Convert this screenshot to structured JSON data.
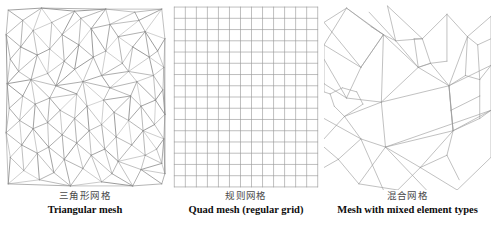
{
  "figure": {
    "background_color": "#ffffff",
    "mesh_line_color": "#8a8a8a",
    "caption_cn_color": "#4a4a4a",
    "caption_en_color": "#0d0d0d",
    "panel_count": 3
  },
  "panels": [
    {
      "id": "triangular-mesh",
      "caption_cn": "三角形网格",
      "caption_en": "Triangular mesh",
      "mesh_type": "unstructured-triangles",
      "viewbox": "0 0 160 182",
      "stroke": "#8f8f8f",
      "stroke_width": 0.55,
      "points": [
        [
          6,
          6
        ],
        [
          38,
          4
        ],
        [
          70,
          7
        ],
        [
          100,
          5
        ],
        [
          128,
          8
        ],
        [
          154,
          5
        ],
        [
          4,
          30
        ],
        [
          30,
          26
        ],
        [
          58,
          30
        ],
        [
          86,
          24
        ],
        [
          112,
          32
        ],
        [
          138,
          27
        ],
        [
          157,
          34
        ],
        [
          8,
          54
        ],
        [
          34,
          50
        ],
        [
          60,
          56
        ],
        [
          88,
          52
        ],
        [
          116,
          58
        ],
        [
          142,
          52
        ],
        [
          156,
          62
        ],
        [
          5,
          78
        ],
        [
          28,
          74
        ],
        [
          52,
          80
        ],
        [
          78,
          76
        ],
        [
          104,
          82
        ],
        [
          130,
          76
        ],
        [
          155,
          84
        ],
        [
          7,
          102
        ],
        [
          32,
          98
        ],
        [
          56,
          104
        ],
        [
          82,
          100
        ],
        [
          108,
          106
        ],
        [
          134,
          100
        ],
        [
          157,
          108
        ],
        [
          4,
          126
        ],
        [
          30,
          122
        ],
        [
          58,
          128
        ],
        [
          84,
          124
        ],
        [
          110,
          130
        ],
        [
          136,
          124
        ],
        [
          156,
          132
        ],
        [
          8,
          150
        ],
        [
          34,
          146
        ],
        [
          60,
          152
        ],
        [
          86,
          148
        ],
        [
          112,
          154
        ],
        [
          138,
          148
        ],
        [
          154,
          156
        ],
        [
          6,
          176
        ],
        [
          36,
          172
        ],
        [
          66,
          178
        ],
        [
          96,
          174
        ],
        [
          126,
          178
        ],
        [
          154,
          176
        ],
        [
          20,
          16
        ],
        [
          48,
          18
        ],
        [
          76,
          14
        ],
        [
          104,
          20
        ],
        [
          132,
          16
        ],
        [
          18,
          42
        ],
        [
          46,
          44
        ],
        [
          74,
          40
        ],
        [
          100,
          46
        ],
        [
          126,
          42
        ],
        [
          150,
          46
        ],
        [
          16,
          66
        ],
        [
          44,
          68
        ],
        [
          70,
          64
        ],
        [
          96,
          70
        ],
        [
          122,
          66
        ],
        [
          146,
          70
        ],
        [
          20,
          90
        ],
        [
          46,
          92
        ],
        [
          72,
          88
        ],
        [
          98,
          94
        ],
        [
          124,
          90
        ],
        [
          148,
          94
        ],
        [
          17,
          114
        ],
        [
          44,
          116
        ],
        [
          70,
          112
        ],
        [
          96,
          118
        ],
        [
          122,
          114
        ],
        [
          147,
          118
        ],
        [
          19,
          138
        ],
        [
          45,
          140
        ],
        [
          72,
          136
        ],
        [
          99,
          142
        ],
        [
          125,
          138
        ],
        [
          149,
          142
        ],
        [
          21,
          163
        ],
        [
          50,
          165
        ],
        [
          78,
          161
        ],
        [
          106,
          166
        ],
        [
          134,
          162
        ],
        [
          157,
          166
        ]
      ],
      "edge_density": "delaunay-like"
    },
    {
      "id": "quad-mesh",
      "caption_cn": "规则网格",
      "caption_en": "Quad mesh (regular grid)",
      "mesh_type": "structured-quads",
      "viewbox": "0 0 136 182",
      "stroke": "#9a9a9a",
      "stroke_width": 0.6,
      "grid": {
        "columns": 13,
        "rows": 16,
        "x0": 3,
        "y0": 3,
        "x1": 133,
        "y1": 179
      }
    },
    {
      "id": "mixed-mesh",
      "caption_cn": "混合网格",
      "caption_en": "Mesh with mixed element types",
      "mesh_type": "hybrid-quads-and-triangles",
      "viewbox": "0 0 163 182",
      "stroke": "#9a9a9a",
      "stroke_width": 0.6,
      "segments": [
        [
          0,
          18,
          22,
          4
        ],
        [
          22,
          4,
          58,
          30
        ],
        [
          58,
          30,
          36,
          62
        ],
        [
          36,
          62,
          0,
          40
        ],
        [
          0,
          40,
          22,
          4
        ],
        [
          22,
          4,
          46,
          22
        ],
        [
          46,
          22,
          58,
          30
        ],
        [
          0,
          18,
          36,
          62
        ],
        [
          36,
          62,
          58,
          30
        ],
        [
          36,
          62,
          22,
          92
        ],
        [
          22,
          92,
          0,
          78
        ],
        [
          0,
          78,
          0,
          40
        ],
        [
          22,
          92,
          56,
          96
        ],
        [
          56,
          96,
          58,
          30
        ],
        [
          44,
          8,
          70,
          36
        ],
        [
          70,
          36,
          58,
          30
        ],
        [
          62,
          2,
          96,
          34
        ],
        [
          96,
          34,
          70,
          36
        ],
        [
          70,
          36,
          62,
          2
        ],
        [
          96,
          34,
          120,
          10
        ],
        [
          120,
          10,
          140,
          32
        ],
        [
          140,
          32,
          163,
          12
        ],
        [
          96,
          34,
          104,
          58
        ],
        [
          104,
          58,
          120,
          56
        ],
        [
          120,
          56,
          120,
          10
        ],
        [
          104,
          58,
          122,
          80
        ],
        [
          122,
          80,
          140,
          32
        ],
        [
          70,
          36,
          92,
          62
        ],
        [
          92,
          62,
          104,
          58
        ],
        [
          58,
          30,
          92,
          62
        ],
        [
          92,
          62,
          56,
          96
        ],
        [
          56,
          96,
          122,
          80
        ],
        [
          122,
          80,
          163,
          60
        ],
        [
          163,
          60,
          163,
          12
        ],
        [
          56,
          96,
          60,
          140
        ],
        [
          60,
          140,
          126,
          124
        ],
        [
          126,
          124,
          122,
          80
        ],
        [
          60,
          140,
          163,
          104
        ],
        [
          163,
          104,
          163,
          60
        ],
        [
          56,
          96,
          20,
          110
        ],
        [
          20,
          110,
          10,
          100
        ],
        [
          10,
          100,
          6,
          88
        ],
        [
          6,
          88,
          18,
          82
        ],
        [
          18,
          82,
          32,
          86
        ],
        [
          32,
          86,
          38,
          98
        ],
        [
          38,
          98,
          20,
          110
        ],
        [
          6,
          88,
          0,
          86
        ],
        [
          0,
          86,
          0,
          78
        ],
        [
          20,
          110,
          36,
          132
        ],
        [
          36,
          132,
          60,
          140
        ],
        [
          36,
          132,
          14,
          152
        ],
        [
          14,
          152,
          0,
          140
        ],
        [
          14,
          152,
          34,
          176
        ],
        [
          34,
          176,
          60,
          140
        ],
        [
          34,
          176,
          72,
          182
        ],
        [
          72,
          182,
          94,
          160
        ],
        [
          94,
          160,
          60,
          140
        ],
        [
          94,
          160,
          126,
          124
        ],
        [
          94,
          160,
          130,
          182
        ],
        [
          130,
          182,
          163,
          150
        ],
        [
          163,
          150,
          163,
          104
        ],
        [
          0,
          112,
          36,
          132
        ],
        [
          0,
          160,
          14,
          152
        ],
        [
          60,
          140,
          100,
          182
        ],
        [
          36,
          132,
          58,
          182
        ],
        [
          126,
          124,
          163,
          104
        ],
        [
          122,
          80,
          126,
          124
        ],
        [
          92,
          62,
          122,
          80
        ],
        [
          104,
          58,
          92,
          62
        ],
        [
          88,
          34,
          96,
          34
        ],
        [
          88,
          34,
          92,
          62
        ],
        [
          58,
          30,
          46,
          22
        ],
        [
          150,
          40,
          163,
          34
        ],
        [
          140,
          32,
          150,
          40
        ],
        [
          150,
          40,
          152,
          74
        ],
        [
          152,
          74,
          163,
          60
        ],
        [
          140,
          32,
          138,
          70
        ],
        [
          138,
          70,
          152,
          74
        ],
        [
          138,
          70,
          122,
          80
        ],
        [
          122,
          80,
          124,
          104
        ],
        [
          124,
          104,
          152,
          90
        ],
        [
          152,
          90,
          152,
          74
        ],
        [
          124,
          104,
          126,
          124
        ],
        [
          126,
          124,
          152,
          112
        ],
        [
          152,
          112,
          152,
          90
        ],
        [
          152,
          112,
          163,
          104
        ],
        [
          94,
          160,
          120,
          148
        ],
        [
          120,
          148,
          126,
          124
        ],
        [
          120,
          148,
          132,
          172
        ],
        [
          0,
          132,
          20,
          110
        ],
        [
          0,
          54,
          22,
          92
        ]
      ]
    }
  ]
}
